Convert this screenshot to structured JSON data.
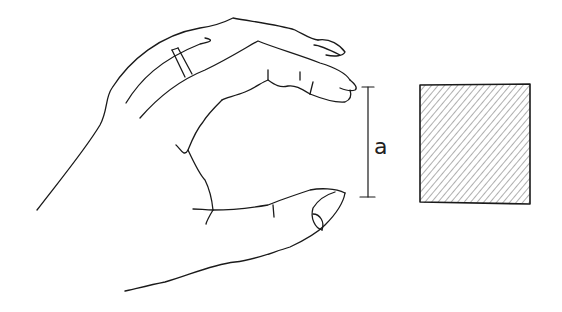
{
  "figure": {
    "dimension_label": "a",
    "colors": {
      "ink": "#1a1a1a",
      "hatch": "#9a9a9a",
      "background": "#ffffff"
    }
  }
}
